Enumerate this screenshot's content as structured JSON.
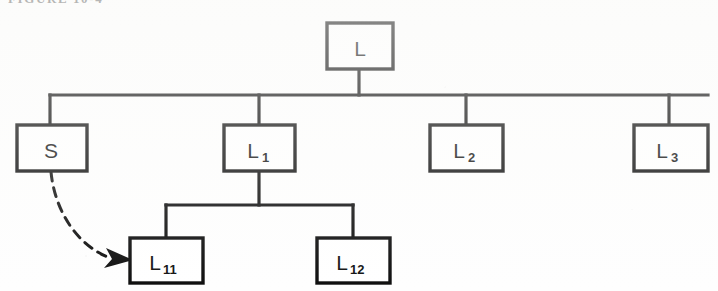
{
  "figure": {
    "caption_remnant": "FIGURE 10-4",
    "type": "hierarchy-tree-diagram",
    "background_color": "#fefefe",
    "ink_color": "#0d0d0d"
  },
  "nodes": {
    "root": {
      "id": "L",
      "label": "L",
      "subscript": ""
    },
    "s": {
      "id": "S",
      "label": "S",
      "subscript": ""
    },
    "l1": {
      "id": "L1",
      "label": "L",
      "subscript": "1"
    },
    "l2": {
      "id": "L2",
      "label": "L",
      "subscript": "2"
    },
    "l3": {
      "id": "L3",
      "label": "L",
      "subscript": "3"
    },
    "l11": {
      "id": "L11",
      "label": "L",
      "subscript": "11"
    },
    "l12": {
      "id": "L12",
      "label": "L",
      "subscript": "12"
    }
  },
  "relations": {
    "root_children": [
      "S",
      "L1",
      "L2",
      "L3"
    ],
    "l1_children": [
      "L11",
      "L12"
    ],
    "dashed_arrow": {
      "from": "S",
      "to": "L11",
      "style": "dashed-curved-arrow"
    }
  }
}
